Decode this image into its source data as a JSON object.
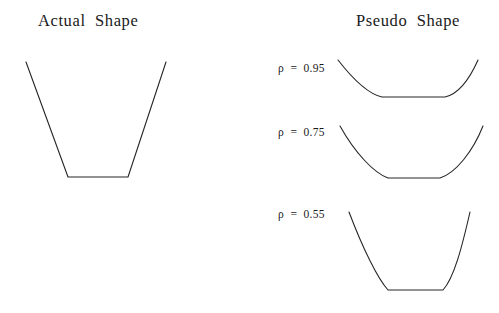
{
  "figure": {
    "panels": [
      {
        "id": "actual",
        "title": "Actual  Shape"
      },
      {
        "id": "pseudo",
        "title": "Pseudo  Shape"
      }
    ],
    "rho_labels": [
      {
        "text": "ρ  =  0.95",
        "value": 0.95
      },
      {
        "text": "ρ  =  0.75",
        "value": 0.75
      },
      {
        "text": "ρ  =  0.55",
        "value": 0.55
      }
    ]
  },
  "chart_data": {
    "type": "line",
    "xlabel": "",
    "ylabel": "",
    "grid": false,
    "legend_position": "none",
    "annotations": [
      "Actual  Shape",
      "Pseudo  Shape",
      "ρ  =  0.95",
      "ρ  =  0.75",
      "ρ  =  0.55"
    ],
    "series": [
      {
        "name": "Actual Shape",
        "shape": "trapezoid",
        "style": "straight-segments",
        "path": "M 26 62 L 68 177 L 128 177 L 166 62",
        "points": [
          [
            26,
            62
          ],
          [
            68,
            177
          ],
          [
            128,
            177
          ],
          [
            166,
            62
          ]
        ],
        "depth": 115,
        "flat_bottom_width": 60
      },
      {
        "name": "Pseudo Shape rho = 0.95",
        "rho": 0.95,
        "style": "curved-segments",
        "path": "M 338 60 C 352 78, 368 94, 382 97 L 445 97 C 459 94, 470 78, 478 60",
        "points": [
          [
            338,
            60
          ],
          [
            382,
            97
          ],
          [
            445,
            97
          ],
          [
            478,
            60
          ]
        ],
        "depth": 37,
        "flat_bottom_width": 63
      },
      {
        "name": "Pseudo Shape rho = 0.75",
        "rho": 0.75,
        "style": "curved-segments",
        "path": "M 340 126 C 355 153, 374 173, 388 178 L 440 178 C 456 173, 473 151, 483 126",
        "points": [
          [
            340,
            126
          ],
          [
            388,
            178
          ],
          [
            440,
            178
          ],
          [
            483,
            126
          ]
        ],
        "depth": 52,
        "flat_bottom_width": 52
      },
      {
        "name": "Pseudo Shape rho = 0.55",
        "rho": 0.55,
        "style": "curved-segments",
        "path": "M 349 212 C 363 249, 378 279, 388 290 L 443 290 C 454 278, 462 247, 470 212",
        "points": [
          [
            349,
            212
          ],
          [
            388,
            290
          ],
          [
            443,
            290
          ],
          [
            470,
            212
          ]
        ],
        "depth": 78,
        "flat_bottom_width": 55
      }
    ]
  },
  "colors": {
    "background": "#ffffff",
    "stroke": "#262626",
    "text": "#1a1a1a"
  }
}
